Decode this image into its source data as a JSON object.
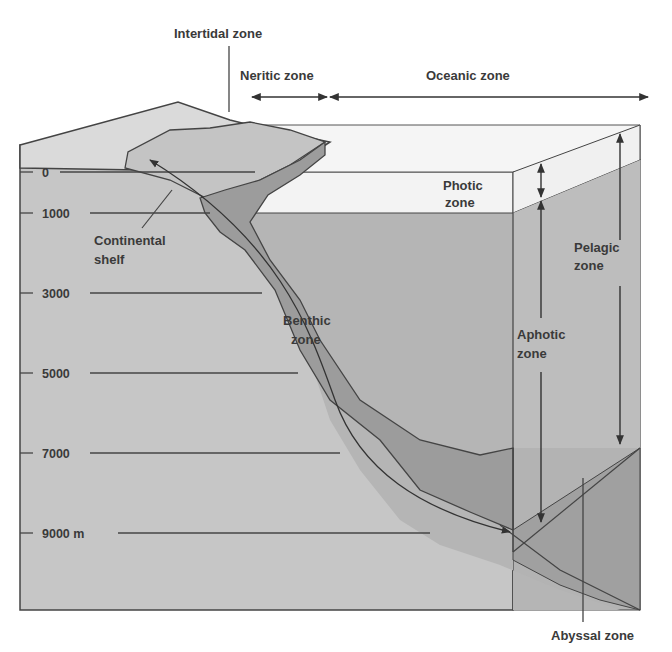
{
  "diagram": {
    "type": "ocean-zones-cross-section",
    "colors": {
      "seafloor_front": "#c6c6c6",
      "shelf_top": "#dcdcdc",
      "water_aphotic": "#b3b3b3",
      "photic_band": "#f3f3f3",
      "benthic_band": "#9a9a9a",
      "abyssal": "#a2a2a2",
      "line": "#444444",
      "text": "#3a3a3a"
    },
    "depth_scale": {
      "labels": [
        "0",
        "1000",
        "3000",
        "5000",
        "7000",
        "9000 m"
      ]
    },
    "top_labels": {
      "intertidal": "Intertidal zone",
      "neritic": "Neritic zone",
      "oceanic": "Oceanic zone"
    },
    "zone_labels": {
      "photic_line1": "Photic",
      "photic_line2": "zone",
      "continental_line1": "Continental",
      "continental_line2": "shelf",
      "benthic_line1": "Benthic",
      "benthic_line2": "zone",
      "aphotic_line1": "Aphotic",
      "aphotic_line2": "zone",
      "pelagic_line1": "Pelagic",
      "pelagic_line2": "zone",
      "abyssal": "Abyssal zone"
    }
  }
}
